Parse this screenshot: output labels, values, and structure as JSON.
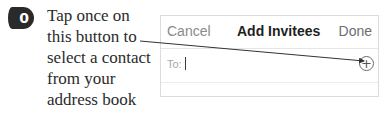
{
  "step": {
    "number": "0",
    "callout_lines": [
      "Tap once on",
      "this button to",
      "select a contact",
      "from your",
      "address book"
    ]
  },
  "panel": {
    "header": {
      "cancel_label": "Cancel",
      "title": "Add Invitees",
      "done_label": "Done"
    },
    "to_field": {
      "label": "To:",
      "value": ""
    },
    "add_contact_icon": "plus-circle-icon",
    "add_contact_glyph": "+"
  },
  "colors": {
    "badge": "#2a2a2a",
    "text": "#2b2b2b",
    "border": "#dcdcdc",
    "cancel": "#8a8a8a"
  }
}
